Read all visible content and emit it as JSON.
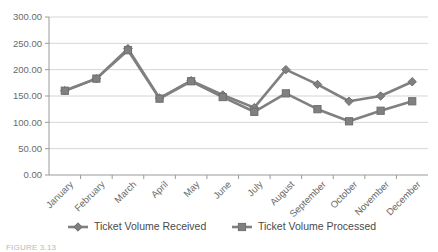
{
  "chart_data": {
    "type": "line",
    "title": "",
    "xlabel": "",
    "ylabel": "",
    "ylim": [
      0,
      300
    ],
    "ytick_step": 50,
    "grid": true,
    "legend_position": "bottom",
    "categories": [
      "January",
      "February",
      "March",
      "April",
      "May",
      "June",
      "July",
      "August",
      "September",
      "October",
      "November",
      "December"
    ],
    "ytick_labels": [
      "300.00",
      "250.00",
      "200.00",
      "150.00",
      "100.00",
      "50.00",
      "0.00"
    ],
    "ytick_values": [
      300,
      250,
      200,
      150,
      100,
      50,
      0
    ],
    "series": [
      {
        "name": "Ticket Volume Received",
        "marker": "diamond",
        "color": "#808080",
        "values": [
          160,
          183,
          240,
          146,
          179,
          152,
          128,
          200,
          172,
          140,
          150,
          177
        ]
      },
      {
        "name": "Ticket Volume Processed",
        "marker": "square",
        "color": "#808080",
        "values": [
          160,
          183,
          237,
          145,
          178,
          148,
          120,
          155,
          125,
          102,
          122,
          140
        ]
      }
    ]
  },
  "legend": {
    "items": [
      {
        "label": "Ticket Volume Received",
        "marker": "diamond"
      },
      {
        "label": "Ticket Volume Processed",
        "marker": "square"
      }
    ]
  },
  "caption": {
    "figure_number": "FIGURE 3.13",
    "text": "FIGURE 3.13"
  }
}
